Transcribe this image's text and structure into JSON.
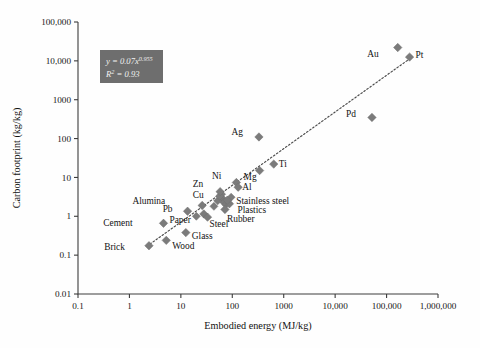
{
  "chart_data": {
    "type": "scatter",
    "title": "",
    "xlabel": "Embodied energy (MJ/kg)",
    "ylabel": "Carbon footprint (kg/kg)",
    "xscale": "log",
    "yscale": "log",
    "xlim": [
      0.1,
      1000000
    ],
    "ylim": [
      0.01,
      100000
    ],
    "grid": false,
    "legend": "none",
    "xticklabels": [
      "0.1",
      "1",
      "10",
      "100",
      "1000",
      "10,000",
      "100,000",
      "1,000,000"
    ],
    "yticklabels": [
      "0.01",
      "0.1",
      "1",
      "10",
      "100",
      "1000",
      "10,000",
      "100,000"
    ],
    "xtickvalues": [
      0.1,
      1,
      10,
      100,
      1000,
      10000,
      100000,
      1000000
    ],
    "ytickvalues": [
      0.01,
      0.1,
      1,
      10,
      100,
      1000,
      10000,
      100000
    ],
    "marker_shape": "diamond",
    "marker_color": "#7b7b7b",
    "annotation": {
      "equation": "y = 0.07x",
      "exponent": "0.955",
      "r2_prefix": "R",
      "r2_sup": "2",
      "r2_value": " = 0.93",
      "box_color": "#6e6e6e",
      "text_color": "#f2f2f2"
    },
    "trendline": {
      "style": "dotted",
      "color": "#4a4a4a",
      "x_start": 2.2,
      "y_start": 0.17,
      "x_end": 300000,
      "y_end": 12000
    },
    "points": [
      {
        "label": "Brick",
        "x": 2.4,
        "y": 0.175,
        "label_dx": -24,
        "label_dy": 4
      },
      {
        "label": "Wood",
        "x": 5.2,
        "y": 0.24,
        "label_dx": 6,
        "label_dy": 9
      },
      {
        "label": "Cement",
        "x": 4.6,
        "y": 0.66,
        "label_dx": -31,
        "label_dy": 3
      },
      {
        "label": "Glass",
        "x": 12.5,
        "y": 0.38,
        "label_dx": 6,
        "label_dy": 6
      },
      {
        "label": "Paper",
        "x": 28,
        "y": 1.15,
        "label_dx": -13,
        "label_dy": 9
      },
      {
        "label": "Steel",
        "x": 33,
        "y": 0.95,
        "label_dx": 2,
        "label_dy": 10
      },
      {
        "label": "Pb",
        "x": 13.5,
        "y": 1.35,
        "label_dx": -15,
        "label_dy": 1
      },
      {
        "label": "Alumina",
        "x": 26,
        "y": 1.9,
        "label_dx": -37,
        "label_dy": -1
      },
      {
        "label": "Cu",
        "x": 57,
        "y": 3.3,
        "label_dx": -16,
        "label_dy": 2
      },
      {
        "label": "Zn",
        "x": 58,
        "y": 4.3,
        "label_dx": -17,
        "label_dy": -5
      },
      {
        "label": "Rubber",
        "x": 72,
        "y": 1.5,
        "label_dx": 2,
        "label_dy": 13
      },
      {
        "label": "Plastics",
        "x": 88,
        "y": 2.1,
        "label_dx": 8,
        "label_dy": 9
      },
      {
        "label": "Stainless steel",
        "x": 80,
        "y": 2.6,
        "label_dx": 9,
        "label_dy": 4
      },
      {
        "label": "Ni",
        "x": 120,
        "y": 7.4,
        "label_dx": -15,
        "label_dy": -4
      },
      {
        "label": "Al",
        "x": 130,
        "y": 5.6,
        "label_dx": 4,
        "label_dy": 3
      },
      {
        "label": "Mg",
        "x": 340,
        "y": 15,
        "label_dx": -3,
        "label_dy": 9
      },
      {
        "label": "Ti",
        "x": 640,
        "y": 22,
        "label_dx": 5,
        "label_dy": 3
      },
      {
        "label": "Ag",
        "x": 330,
        "y": 110,
        "label_dx": -16,
        "label_dy": -2
      },
      {
        "label": "Pd",
        "x": 52000,
        "y": 350,
        "label_dx": -16,
        "label_dy": 0
      },
      {
        "label": "Au",
        "x": 165000,
        "y": 22000,
        "label_dx": -19,
        "label_dy": 9
      },
      {
        "label": "Pt",
        "x": 280000,
        "y": 12500,
        "label_dx": 6,
        "label_dy": 1
      }
    ],
    "extra_points": [
      {
        "x": 64,
        "y": 2.9
      },
      {
        "x": 68,
        "y": 2.3
      },
      {
        "x": 75,
        "y": 2.0
      },
      {
        "x": 62,
        "y": 3.7
      },
      {
        "x": 52,
        "y": 2.5
      },
      {
        "x": 95,
        "y": 3.1
      },
      {
        "x": 44,
        "y": 1.8
      },
      {
        "x": 20,
        "y": 1.0
      }
    ]
  }
}
